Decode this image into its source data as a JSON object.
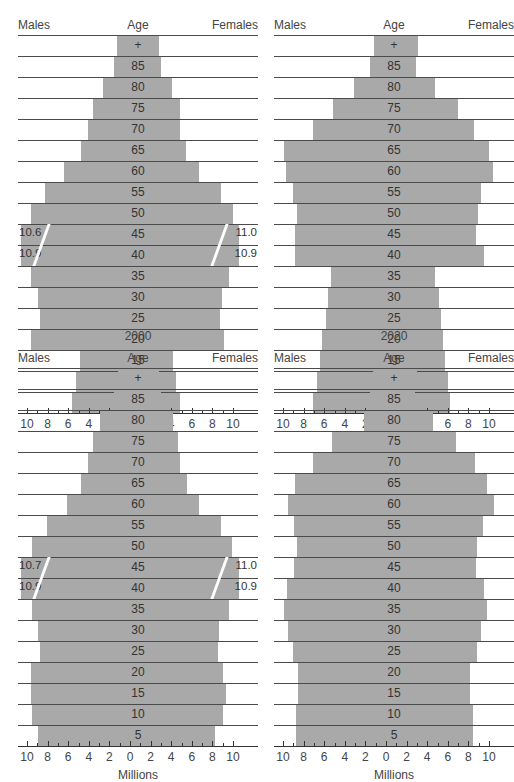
{
  "labels": {
    "males": "Males",
    "age": "Age",
    "females": "Females",
    "unit": "Millions",
    "ticks": [
      "10",
      "8",
      "6",
      "4",
      "2",
      "0",
      "2",
      "4",
      "6",
      "8",
      "10"
    ]
  },
  "panels": [
    {
      "id": "top-left",
      "year_label": ""
    },
    {
      "id": "top-right",
      "year_label": ""
    },
    {
      "id": "bottom-left",
      "year_label": "2000"
    },
    {
      "id": "bottom-right",
      "year_label": "2020"
    }
  ],
  "chart_data": [
    {
      "type": "bar",
      "subtype": "population-pyramid",
      "title": "",
      "xlabel": "Millions",
      "ylabel": "Age",
      "xlim": [
        -10,
        10
      ],
      "categories": [
        "+",
        "85",
        "80",
        "75",
        "70",
        "65",
        "60",
        "55",
        "50",
        "45",
        "40",
        "35",
        "30",
        "25",
        "20",
        "15",
        "10",
        "5"
      ],
      "series": [
        {
          "name": "Males",
          "values": [
            1.3,
            1.6,
            2.6,
            3.6,
            4.1,
            4.8,
            6.4,
            8.3,
            9.6,
            10.6,
            10.9,
            9.6,
            8.9,
            8.7,
            9.6,
            4.9,
            5.2,
            5.6
          ]
        },
        {
          "name": "Females",
          "values": [
            2.8,
            3.0,
            4.1,
            4.9,
            4.9,
            5.4,
            6.7,
            8.8,
            10.0,
            11.0,
            10.9,
            9.6,
            8.9,
            8.7,
            9.1,
            4.2,
            4.5,
            4.9
          ]
        }
      ],
      "annotations": [
        {
          "age": "45",
          "males": "10.6",
          "females": "11.0"
        },
        {
          "age": "40",
          "males": "10.9",
          "females": "10.9"
        }
      ]
    },
    {
      "type": "bar",
      "subtype": "population-pyramid",
      "title": "2020",
      "xlabel": "Millions",
      "ylabel": "Age",
      "xlim": [
        -10,
        10
      ],
      "categories": [
        "+",
        "85",
        "80",
        "75",
        "70",
        "65",
        "60",
        "55",
        "50",
        "45",
        "40",
        "35",
        "30",
        "25",
        "20",
        "15",
        "10",
        "5"
      ],
      "series": [
        {
          "name": "Males",
          "values": [
            1.2,
            1.6,
            3.1,
            5.1,
            7.1,
            9.9,
            9.7,
            9.0,
            8.6,
            8.8,
            8.8,
            5.3,
            5.6,
            5.8,
            6.2,
            6.4,
            6.7,
            7.1
          ]
        },
        {
          "name": "Females",
          "values": [
            3.1,
            2.9,
            4.8,
            7.0,
            8.5,
            10.0,
            10.4,
            9.2,
            8.9,
            8.7,
            9.5,
            4.8,
            5.1,
            5.3,
            5.5,
            5.7,
            6.0,
            6.2
          ]
        }
      ],
      "annotations": []
    },
    {
      "type": "bar",
      "subtype": "population-pyramid",
      "title": "2000",
      "xlabel": "Millions",
      "ylabel": "Age",
      "xlim": [
        -10,
        10
      ],
      "categories": [
        "+",
        "85",
        "80",
        "75",
        "70",
        "65",
        "60",
        "55",
        "50",
        "45",
        "40",
        "35",
        "30",
        "25",
        "20",
        "15",
        "10",
        "5"
      ],
      "series": [
        {
          "name": "Males",
          "values": [
            1.2,
            1.6,
            2.9,
            3.6,
            4.1,
            4.8,
            6.1,
            8.1,
            9.5,
            10.7,
            10.9,
            9.5,
            8.9,
            8.7,
            9.6,
            9.6,
            9.5,
            8.9
          ]
        },
        {
          "name": "Females",
          "values": [
            2.8,
            3.0,
            4.2,
            4.7,
            4.9,
            5.5,
            6.7,
            8.8,
            9.9,
            11.0,
            10.9,
            9.6,
            8.6,
            8.5,
            9.0,
            9.3,
            9.0,
            8.3
          ]
        }
      ],
      "annotations": [
        {
          "age": "45",
          "males": "10.7",
          "females": "11.0"
        },
        {
          "age": "40",
          "males": "10.9",
          "females": "10.9"
        }
      ]
    },
    {
      "type": "bar",
      "subtype": "population-pyramid",
      "title": "",
      "xlabel": "Millions",
      "ylabel": "Age",
      "xlim": [
        -10,
        10
      ],
      "categories": [
        "+",
        "85",
        "80",
        "75",
        "70",
        "65",
        "60",
        "55",
        "50",
        "45",
        "40",
        "35",
        "30",
        "25",
        "20",
        "15",
        "10",
        "5"
      ],
      "series": [
        {
          "name": "Males",
          "values": [
            1.3,
            1.6,
            2.1,
            5.2,
            7.1,
            8.8,
            9.5,
            8.9,
            8.6,
            8.9,
            9.6,
            9.9,
            9.5,
            9.0,
            8.5,
            8.5,
            8.7,
            8.7
          ]
        },
        {
          "name": "Females",
          "values": [
            3.0,
            2.8,
            4.6,
            6.8,
            8.6,
            9.8,
            10.5,
            9.4,
            8.8,
            8.7,
            9.5,
            9.8,
            9.2,
            8.8,
            8.2,
            8.2,
            8.4,
            8.4
          ]
        }
      ],
      "annotations": []
    }
  ]
}
